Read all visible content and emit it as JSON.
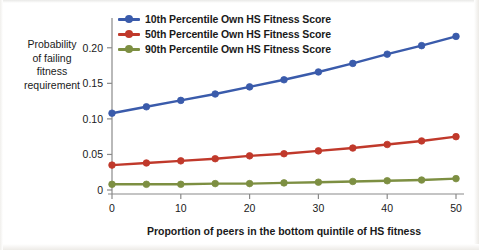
{
  "figure": {
    "ylabel_lines": [
      "Probability",
      "of failing",
      "fitness",
      "requirement"
    ],
    "xlabel": "Proportion of peers in the bottom quintile of HS fitness",
    "colors": {
      "series_10th": "#3a5bab",
      "series_50th": "#c0392b",
      "series_90th": "#7d8f42",
      "axis": "#8a8a8a",
      "text": "#1a1a1a"
    }
  },
  "legend": {
    "position": "top-left-inside",
    "items": [
      {
        "label": "10th Percentile Own HS Fitness Score",
        "color": "#3a5bab"
      },
      {
        "label": "50th Percentile Own HS Fitness Score",
        "color": "#c0392b"
      },
      {
        "label": "90th Percentile Own HS Fitness Score",
        "color": "#7d8f42"
      }
    ]
  },
  "axes": {
    "x_ticks": [
      "0",
      "10",
      "20",
      "30",
      "40",
      "50"
    ],
    "y_ticks": [
      "0",
      "0.05",
      "0.10",
      "0.15",
      "0.20"
    ]
  },
  "chart_data": {
    "type": "line",
    "title": "",
    "xlabel": "Proportion of peers in the bottom quintile of HS fitness",
    "ylabel": "Probability of failing fitness requirement",
    "x": [
      0,
      5,
      10,
      15,
      20,
      25,
      30,
      35,
      40,
      45,
      50
    ],
    "xlim": [
      0,
      50
    ],
    "ylim": [
      0,
      0.225
    ],
    "xticks": [
      0,
      10,
      20,
      30,
      40,
      50
    ],
    "yticks": [
      0,
      0.05,
      0.1,
      0.15,
      0.2
    ],
    "ytick_labels": [
      "0",
      "0.05",
      "0.10",
      "0.15",
      "0.20"
    ],
    "grid": false,
    "markers": "circle",
    "legend_position": "upper left",
    "series": [
      {
        "name": "10th Percentile Own HS Fitness Score",
        "color": "#3a5bab",
        "values": [
          0.108,
          0.117,
          0.126,
          0.135,
          0.145,
          0.155,
          0.166,
          0.178,
          0.191,
          0.203,
          0.216
        ]
      },
      {
        "name": "50th Percentile Own HS Fitness Score",
        "color": "#c0392b",
        "values": [
          0.035,
          0.038,
          0.041,
          0.044,
          0.048,
          0.051,
          0.055,
          0.059,
          0.064,
          0.069,
          0.075
        ]
      },
      {
        "name": "90th Percentile Own HS Fitness Score",
        "color": "#7d8f42",
        "values": [
          0.008,
          0.008,
          0.008,
          0.009,
          0.009,
          0.01,
          0.011,
          0.012,
          0.013,
          0.014,
          0.016
        ]
      }
    ]
  }
}
